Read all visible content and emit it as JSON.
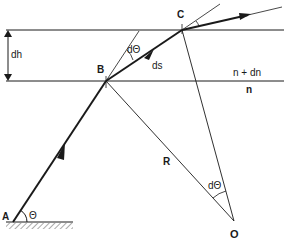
{
  "diagram": {
    "points": {
      "A": {
        "label": "A",
        "x": 13,
        "y": 222
      },
      "B": {
        "label": "B",
        "x": 106,
        "y": 81
      },
      "C": {
        "label": "C",
        "x": 182,
        "y": 30
      },
      "O": {
        "label": "O",
        "x": 234,
        "y": 221
      }
    },
    "labels": {
      "dh": "dh",
      "ds": "ds",
      "dtheta_top": "dΘ",
      "dtheta_bottom": "dΘ",
      "theta": "Θ",
      "R": "R",
      "n_plus_dn": "n + dn",
      "n": "n"
    },
    "colors": {
      "line": "#1a1a1a",
      "background": "#ffffff"
    }
  }
}
